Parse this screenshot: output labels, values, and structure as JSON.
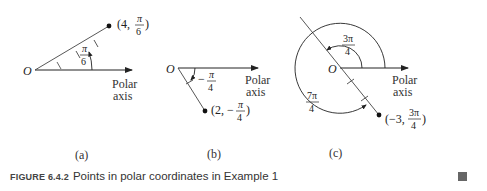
{
  "figure": {
    "panels": [
      {
        "id": "a",
        "label": "(a)",
        "origin": "O",
        "axis_label_1": "Polar",
        "axis_label_2": "axis",
        "angle_num": "π",
        "angle_den": "6",
        "point_prefix": "(4,",
        "point_num": "π",
        "point_den": "6",
        "point_suffix": ")"
      },
      {
        "id": "b",
        "label": "(b)",
        "origin": "O",
        "axis_label_1": "Polar",
        "axis_label_2": "axis",
        "angle_sign": "−",
        "angle_num": "π",
        "angle_den": "4",
        "point_prefix": "(2, −",
        "point_num": "π",
        "point_den": "4",
        "point_suffix": ")"
      },
      {
        "id": "c",
        "label": "(c)",
        "origin": "O",
        "axis_label_1": "Polar",
        "axis_label_2": "axis",
        "angle1_num": "3π",
        "angle1_den": "4",
        "angle2_num": "7π",
        "angle2_den": "4",
        "point_prefix": "(−3,",
        "point_num": "3π",
        "point_den": "4",
        "point_suffix": ")"
      }
    ],
    "caption": {
      "number": "FIGURE 6.4.2",
      "text": "Points in polar coordinates in Example 1"
    }
  }
}
